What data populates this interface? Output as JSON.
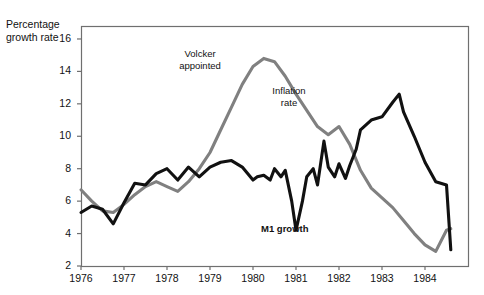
{
  "chart_data": {
    "type": "line",
    "title": "",
    "xlabel": "",
    "ylabel": "Percentage growth rate",
    "ylim": [
      2,
      16.8
    ],
    "xlim": [
      1976.0,
      1985.0
    ],
    "grid": false,
    "legend_position": "inline-annotations",
    "ytick_labels": [
      "2",
      "4",
      "6",
      "8",
      "10",
      "12",
      "14",
      "16"
    ],
    "ytick_values": [
      2,
      4,
      6,
      8,
      10,
      12,
      14,
      16
    ],
    "xtick_labels": [
      "1976",
      "1977",
      "1978",
      "1979",
      "1980",
      "1981",
      "1982",
      "1983",
      "1984"
    ],
    "xtick_values": [
      1976,
      1977,
      1978,
      1979,
      1980,
      1981,
      1982,
      1983,
      1984
    ],
    "series": [
      {
        "name": "Inflation rate",
        "color": "#808080",
        "x": [
          1976.0,
          1976.25,
          1976.5,
          1976.75,
          1977.0,
          1977.25,
          1977.5,
          1977.75,
          1978.0,
          1978.25,
          1978.5,
          1978.75,
          1979.0,
          1979.25,
          1979.5,
          1979.75,
          1980.0,
          1980.25,
          1980.5,
          1980.75,
          1981.0,
          1981.25,
          1981.5,
          1981.75,
          1982.0,
          1982.25,
          1982.5,
          1982.75,
          1983.0,
          1983.25,
          1983.5,
          1983.75,
          1984.0,
          1984.25,
          1984.5,
          1984.6
        ],
        "values": [
          6.7,
          6.0,
          5.4,
          5.3,
          5.8,
          6.4,
          6.9,
          7.2,
          6.9,
          6.6,
          7.2,
          8.0,
          9.0,
          10.4,
          11.8,
          13.2,
          14.3,
          14.8,
          14.6,
          13.7,
          12.6,
          11.6,
          10.6,
          10.1,
          10.6,
          9.5,
          7.9,
          6.8,
          6.2,
          5.6,
          4.8,
          4.0,
          3.3,
          2.9,
          4.2,
          4.3
        ]
      },
      {
        "name": "M1 growth",
        "color": "#111111",
        "x": [
          1976.0,
          1976.25,
          1976.5,
          1976.75,
          1977.0,
          1977.25,
          1977.5,
          1977.75,
          1978.0,
          1978.25,
          1978.5,
          1978.75,
          1979.0,
          1979.25,
          1979.5,
          1979.75,
          1980.0,
          1980.1,
          1980.25,
          1980.4,
          1980.5,
          1980.65,
          1980.75,
          1980.9,
          1981.0,
          1981.15,
          1981.25,
          1981.4,
          1981.5,
          1981.65,
          1981.75,
          1981.9,
          1982.0,
          1982.15,
          1982.25,
          1982.4,
          1982.5,
          1982.75,
          1983.0,
          1983.25,
          1983.4,
          1983.5,
          1983.75,
          1984.0,
          1984.25,
          1984.5,
          1984.6
        ],
        "values": [
          5.3,
          5.7,
          5.5,
          4.6,
          5.9,
          7.1,
          7.0,
          7.7,
          8.0,
          7.3,
          8.1,
          7.5,
          8.1,
          8.4,
          8.5,
          8.1,
          7.3,
          7.5,
          7.6,
          7.3,
          8.0,
          7.5,
          7.9,
          6.0,
          4.2,
          6.0,
          7.5,
          8.0,
          7.0,
          9.7,
          8.1,
          7.5,
          8.3,
          7.4,
          8.2,
          9.2,
          10.4,
          11.0,
          11.2,
          12.1,
          12.6,
          11.5,
          10.0,
          8.4,
          7.2,
          7.0,
          3.0
        ]
      }
    ],
    "annotations": [
      {
        "text_line1": "Volcker",
        "text_line2": "appointed",
        "bold": false
      },
      {
        "text_line1": "Inflation",
        "text_line2": "rate",
        "bold": false
      },
      {
        "text_line1": "M1 growth",
        "text_line2": "",
        "bold": true
      }
    ],
    "axis_title_line1": "Percentage",
    "axis_title_line2": "growth rate"
  },
  "colors": {
    "inflation_line": "#808080",
    "m1_line": "#111111",
    "axis": "#6f6f6f",
    "background": "#ffffff"
  }
}
